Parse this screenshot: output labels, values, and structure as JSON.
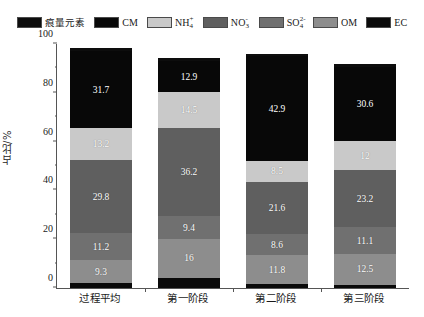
{
  "legend": {
    "items": [
      {
        "label": "痕量元素",
        "plain": "痕量元素",
        "color": "#0d0d0d",
        "cjk": true
      },
      {
        "label": "CM",
        "plain": "CM",
        "color": "#080808",
        "cjk": false
      },
      {
        "label": "NH4+",
        "plain": "NH",
        "sub": "4",
        "sup": "+",
        "color": "#c9c9c9",
        "cjk": false
      },
      {
        "label": "NO3-",
        "plain": "NO",
        "sub": "3",
        "sup": "-",
        "color": "#5f5f5f",
        "cjk": false
      },
      {
        "label": "SO42-",
        "plain": "SO",
        "sub": "4",
        "sup": "2-",
        "color": "#707070",
        "cjk": false
      },
      {
        "label": "OM",
        "plain": "OM",
        "color": "#8d8d8d",
        "cjk": false
      },
      {
        "label": "EC",
        "plain": "EC",
        "color": "#0a0a0a",
        "cjk": false
      }
    ]
  },
  "axes": {
    "y_label": "占比/%",
    "y_ticks": [
      "0",
      "20",
      "40",
      "60",
      "80",
      "100"
    ],
    "y_min": 0,
    "y_max": 100,
    "x_labels": [
      "过程平均",
      "第一阶段",
      "第二阶段",
      "第三阶段"
    ]
  },
  "chart_data": {
    "type": "bar",
    "subtype": "stacked-bar",
    "title": "",
    "xlabel": "",
    "ylabel": "占比/%",
    "ylim": [
      0,
      100
    ],
    "grid": false,
    "legend_position": "top",
    "categories": [
      "过程平均",
      "第一阶段",
      "第二阶段",
      "第三阶段"
    ],
    "stack_order_bottom_to_top": [
      "EC",
      "OM",
      "SO42-",
      "NO3-",
      "NH4+",
      "CM",
      "痕量元素"
    ],
    "series": [
      {
        "name": "EC",
        "color": "#0a0a0a",
        "values": [
          2.0,
          4.1,
          1.6,
          1.4
        ],
        "labeled": [
          false,
          false,
          false,
          false
        ]
      },
      {
        "name": "OM",
        "color": "#8d8d8d",
        "values": [
          9.3,
          16,
          11.8,
          12.5
        ],
        "labeled": [
          true,
          true,
          true,
          true
        ]
      },
      {
        "name": "SO42-",
        "color": "#707070",
        "values": [
          11.2,
          9.4,
          8.6,
          11.1
        ],
        "labeled": [
          true,
          true,
          true,
          true
        ]
      },
      {
        "name": "NO3-",
        "color": "#5f5f5f",
        "values": [
          29.8,
          36.2,
          21.6,
          23.2
        ],
        "labeled": [
          true,
          true,
          true,
          true
        ]
      },
      {
        "name": "NH4+",
        "color": "#c9c9c9",
        "values": [
          13.2,
          14.5,
          8.5,
          12
        ],
        "labeled": [
          true,
          true,
          true,
          true
        ]
      },
      {
        "name": "CM",
        "color": "#080808",
        "values": [
          31.7,
          12.9,
          42.9,
          30.6
        ],
        "labeled": [
          true,
          true,
          true,
          true
        ]
      },
      {
        "name": "痕量元素",
        "color": "#0d0d0d",
        "values": [
          1.0,
          1.0,
          1.0,
          1.0
        ],
        "labeled": [
          false,
          false,
          false,
          false
        ]
      }
    ],
    "totals": [
      98.2,
      94.1,
      96.0,
      91.8
    ]
  }
}
